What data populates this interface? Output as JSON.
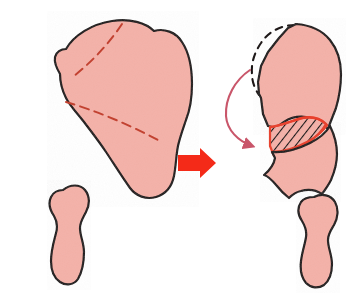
{
  "figure": {
    "caption": "",
    "width": 359,
    "height": 295,
    "background_color": "#FFFFFF"
  },
  "colors": {
    "bone_fill": "#F4B1A8",
    "bone_fill_light": "#F6BDB4",
    "bone_outline": "#1A1414",
    "cut_line_red": "#C24231",
    "arrow_red": "#F42A18",
    "rotation_arrow_red": "#C9566A",
    "wedge_edge_red": "#E8402C",
    "hatch_black": "#141414",
    "dashed_ghost_outline": "#1A1414"
  },
  "panels": [
    {
      "id": "before",
      "label": "Before osteotomy",
      "position": "left",
      "parts": [
        {
          "name": "ilium-body",
          "label": "Ilium / innominate bone",
          "fill": "#F4B1A8"
        },
        {
          "name": "ischiopubic-fragment",
          "label": "Ischiopubic segment",
          "fill": "#F4B1A8"
        }
      ],
      "annotations": [
        {
          "name": "upper-cut-line",
          "label": "Upper osteotomy cut line",
          "style": "dashed",
          "color": "#C24231"
        },
        {
          "name": "lower-cut-line",
          "label": "Lower osteotomy cut line",
          "style": "dashed",
          "color": "#C24231"
        }
      ]
    },
    {
      "id": "after",
      "label": "After osteotomy and rotation",
      "position": "right",
      "parts": [
        {
          "name": "rotated-superior-fragment",
          "label": "Rotated superior fragment",
          "fill": "#F4B1A8"
        },
        {
          "name": "bone-graft-wedge",
          "label": "Hatched bone graft wedge",
          "fill": "hatched"
        },
        {
          "name": "inferior-fragment",
          "label": "Inferior fragment",
          "fill": "#F4B1A8"
        },
        {
          "name": "ischiopubic-fragment",
          "label": "Ischiopubic segment",
          "fill": "#F4B1A8"
        }
      ],
      "annotations": [
        {
          "name": "ghost-outline",
          "label": "Original pre-rotation bone contour",
          "style": "dashed",
          "color": "#1A1414"
        },
        {
          "name": "rotation-arrow",
          "label": "Direction of fragment rotation",
          "style": "curved-arrow",
          "color": "#C9566A"
        }
      ]
    }
  ],
  "transition": {
    "name": "transition-arrow",
    "label": "Leads to",
    "glyph": "right-arrow",
    "color": "#F42A18"
  }
}
